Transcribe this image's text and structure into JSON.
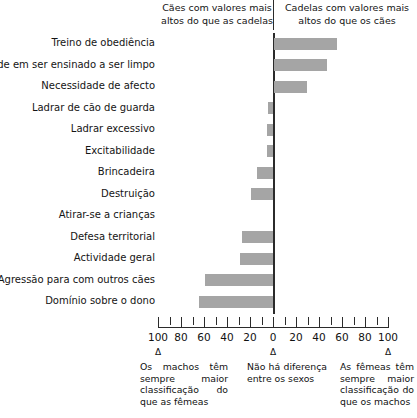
{
  "header": {
    "left_caption": "Cães com valores mais altos do que as cadelas",
    "right_caption": "Cadelas com valores mais altos do que os cães"
  },
  "axis": {
    "tick_labels": [
      "100",
      "80",
      "60",
      "40",
      "20",
      "0",
      "20",
      "40",
      "60",
      "80",
      "100"
    ],
    "delta_marker": "Δ"
  },
  "notes": {
    "left": "Os machos têm sempre maior classificação do que as fêmeas",
    "middle": "Não há diferença entre os sexos",
    "right": "As fêmeas têm sempre maior classificação do que os machos"
  },
  "categories": [
    "Treino de obediência",
    "Facilidade em ser ensinado a ser limpo",
    "Necessidade de afecto",
    "Ladrar de cão de guarda",
    "Ladrar excessivo",
    "Excitabilidade",
    "Brincadeira",
    "Destruição",
    "Atirar-se a crianças",
    "Defesa territorial",
    "Actividade geral",
    "Agressão para com outros cães",
    "Domínio sobre o dono"
  ],
  "chart_data": {
    "type": "bar",
    "orientation": "horizontal",
    "title": "",
    "xlabel": "",
    "ylabel": "",
    "xlim": [
      -100,
      100
    ],
    "grid": false,
    "legend": "none",
    "bar_color": "#a5a5a5",
    "axis_color": "#2b2b2b",
    "note": "Negative values extend left (machos/cães higher); positive values extend right (fêmeas/cadelas higher). Axis is labelled 100-0-100 with absolute magnitudes on both sides.",
    "categories": [
      "Treino de obediência",
      "Facilidade em ser ensinado a ser limpo",
      "Necessidade de afecto",
      "Ladrar de cão de guarda",
      "Ladrar excessivo",
      "Excitabilidade",
      "Brincadeira",
      "Destruição",
      "Atirar-se a crianças",
      "Defesa territorial",
      "Actividade geral",
      "Agressão para com outros cães",
      "Domínio sobre o dono"
    ],
    "values": [
      55,
      46,
      29,
      -4,
      -5,
      -5,
      -14,
      -19,
      0,
      -27,
      -29,
      -59,
      -64
    ]
  }
}
